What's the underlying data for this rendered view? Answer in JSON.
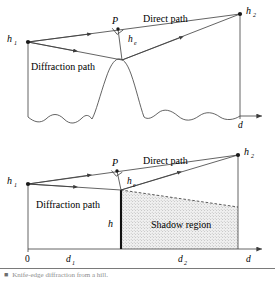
{
  "figure": {
    "stroke_color": "#3c3c3c",
    "text_color": "#1a1a1a",
    "shadow_fill": "#ededed",
    "caption_color": "#8d8d8d",
    "panels": [
      {
        "id": "top",
        "name": "hill-profile-panel",
        "description": "Diffraction over a rounded hill on undulating terrain",
        "labels": {
          "h1": "h",
          "h1_sub": "1",
          "h2": "h",
          "h2_sub": "2",
          "point_p": "P",
          "he": "h",
          "he_sub": "e",
          "direct_path": "Direct path",
          "diffraction_path": "Diffraction path",
          "d": "d"
        }
      },
      {
        "id": "bottom",
        "name": "knife-edge-panel",
        "description": "Equivalent knife-edge model with shadow region",
        "labels": {
          "h1": "h",
          "h1_sub": "1",
          "h2": "h",
          "h2_sub": "2",
          "point_p": "P",
          "he": "h",
          "he_sub": "e",
          "h": "h",
          "direct_path": "Direct path",
          "diffraction_path": "Diffraction path",
          "shadow_region": "Shadow region",
          "axis_origin": "0",
          "d1": "d",
          "d1_sub": "1",
          "d2": "d",
          "d2_sub": "2",
          "d": "d"
        }
      }
    ]
  },
  "caption": {
    "marker": "■",
    "text": "Knife-edge diffraction from a hill."
  }
}
